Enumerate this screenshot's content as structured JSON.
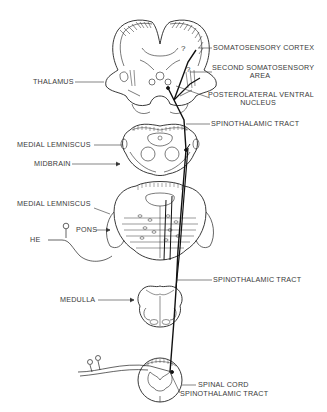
{
  "diagram": {
    "labels": {
      "somatosensory_cortex": "SOMATOSENSORY CORTEX",
      "second_somatosensory_1": "SECOND SOMATOSENSORY",
      "second_somatosensory_2": "AREA",
      "posterolateral_1": "POSTEROLATERAL VENTRAL",
      "posterolateral_2": "NUCLEUS",
      "thalamus": "THALAMUS",
      "spinothalamic_tract_upper": "SPINOTHALAMIC TRACT",
      "medial_lemniscus_upper": "MEDIAL LEMNISCUS",
      "midbrain": "MIDBRAIN",
      "medial_lemniscus_lower": "MEDIAL LEMNISCUS",
      "pons": "PONS",
      "he": "HE",
      "spinothalamic_tract_middle": "SPINOTHALAMIC TRACT",
      "medulla": "MEDULLA",
      "spinal_cord": "SPINAL CORD",
      "spinothalamic_tract_lower": "SPINOTHALAMIC TRACT",
      "question_mark": "?"
    }
  }
}
